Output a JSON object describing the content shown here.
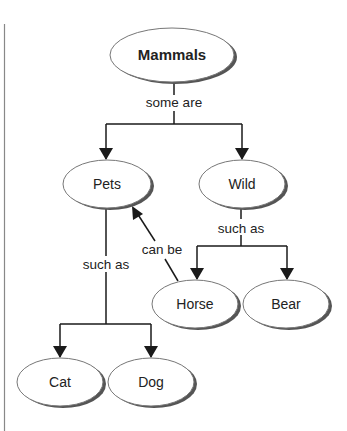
{
  "diagram": {
    "type": "concept-map",
    "colors": {
      "line": "#1a1a1a",
      "ellipse_outline": "#777777",
      "ellipse_shadow": "#555555",
      "ellipse_fill": "#ffffff",
      "page_border": "#888888"
    },
    "nodes": {
      "mammals": {
        "label": "Mammals"
      },
      "pets": {
        "label": "Pets"
      },
      "wild": {
        "label": "Wild"
      },
      "horse": {
        "label": "Horse"
      },
      "bear": {
        "label": "Bear"
      },
      "cat": {
        "label": "Cat"
      },
      "dog": {
        "label": "Dog"
      }
    },
    "edges": {
      "mammals_to_categories": {
        "label": "some are",
        "from": "Mammals",
        "to": [
          "Pets",
          "Wild"
        ]
      },
      "wild_to_examples": {
        "label": "such as",
        "from": "Wild",
        "to": [
          "Horse",
          "Bear"
        ]
      },
      "pets_to_examples": {
        "label": "such as",
        "from": "Pets",
        "to": [
          "Cat",
          "Dog"
        ]
      },
      "horse_to_pets": {
        "label": "can be",
        "from": "Horse",
        "to": "Pets"
      }
    }
  }
}
